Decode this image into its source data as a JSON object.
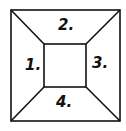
{
  "diagram": {
    "type": "frustum-top-view",
    "outer_square": {
      "x1": 11,
      "y1": 10,
      "x2": 120,
      "y2": 121
    },
    "inner_square": {
      "x1": 44,
      "y1": 44,
      "x2": 86,
      "y2": 87
    },
    "line_color": "#111111",
    "labels": [
      {
        "id": "1",
        "text": "1.",
        "region": "left"
      },
      {
        "id": "2",
        "text": "2.",
        "region": "top"
      },
      {
        "id": "3",
        "text": "3.",
        "region": "right"
      },
      {
        "id": "4",
        "text": "4.",
        "region": "bottom"
      }
    ]
  }
}
